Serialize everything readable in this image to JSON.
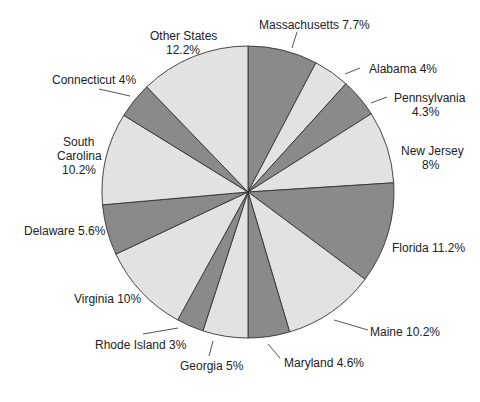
{
  "chart_data": {
    "type": "pie",
    "title": "",
    "start_angle_deg": 0,
    "direction": "clockwise",
    "colors": {
      "light": "#e2e2e2",
      "dark": "#8a8a8a",
      "outline": "#333333",
      "text": "#222222"
    },
    "slices": [
      {
        "label": "Massachusetts",
        "value": 7.7,
        "display": "Massachusetts 7.7%",
        "shade": "dark"
      },
      {
        "label": "Alabama",
        "value": 4.0,
        "display": "Alabama 4%",
        "shade": "light"
      },
      {
        "label": "Pennsylvania",
        "value": 4.3,
        "display": "Pennsylvania 4.3%",
        "shade": "dark"
      },
      {
        "label": "New Jersey",
        "value": 8.0,
        "display": "New Jersey 8%",
        "shade": "light"
      },
      {
        "label": "Florida",
        "value": 11.2,
        "display": "Florida 11.2%",
        "shade": "dark"
      },
      {
        "label": "Maine",
        "value": 10.2,
        "display": "Maine 10.2%",
        "shade": "light"
      },
      {
        "label": "Maryland",
        "value": 4.6,
        "display": "Maryland 4.6%",
        "shade": "dark"
      },
      {
        "label": "Georgia",
        "value": 5.0,
        "display": "Georgia 5%",
        "shade": "light"
      },
      {
        "label": "Rhode Island",
        "value": 3.0,
        "display": "Rhode Island 3%",
        "shade": "dark"
      },
      {
        "label": "Virginia",
        "value": 10.0,
        "display": "Virginia 10%",
        "shade": "light"
      },
      {
        "label": "Delaware",
        "value": 5.6,
        "display": "Delaware 5.6%",
        "shade": "dark"
      },
      {
        "label": "South Carolina",
        "value": 10.2,
        "display": "South Carolina 10.2%",
        "shade": "light"
      },
      {
        "label": "Connecticut",
        "value": 4.0,
        "display": "Connecticut 4%",
        "shade": "dark"
      },
      {
        "label": "Other States",
        "value": 12.2,
        "display": "Other States 12.2%",
        "shade": "light"
      }
    ]
  },
  "labels": {
    "massachusetts": "Massachusetts 7.7%",
    "alabama": "Alabama 4%",
    "pennsylvania_name": "Pennsylvania",
    "pennsylvania_pct": "4.3%",
    "new_jersey_name": "New Jersey",
    "new_jersey_pct": "8%",
    "florida": "Florida 11.2%",
    "maine": "Maine 10.2%",
    "maryland": "Maryland 4.6%",
    "georgia": "Georgia 5%",
    "rhode_island": "Rhode Island 3%",
    "virginia": "Virginia 10%",
    "delaware": "Delaware 5.6%",
    "south_carolina_line1": "South",
    "south_carolina_line2": "Carolina",
    "south_carolina_pct": "10.2%",
    "connecticut": "Connecticut 4%",
    "other_states_name": "Other States",
    "other_states_pct": "12.2%"
  }
}
